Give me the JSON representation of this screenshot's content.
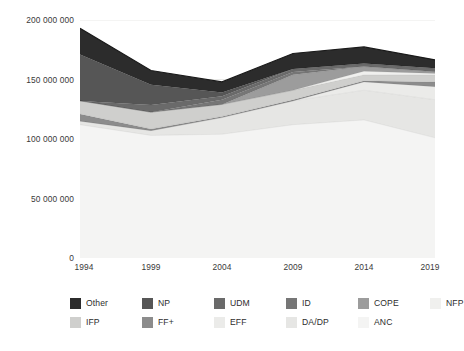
{
  "chart_data": {
    "type": "area",
    "stacked": true,
    "title": "",
    "subtitle": "",
    "xlabel": "",
    "ylabel": "",
    "x": [
      1994,
      1999,
      2004,
      2009,
      2014,
      2019
    ],
    "x_tick_labels": [
      "1994",
      "1999",
      "2004",
      "2009",
      "2014",
      "2019"
    ],
    "y_tick_labels": [
      "0",
      "50 000 000",
      "100 000 000",
      "150 000 000",
      "200 000 000"
    ],
    "y_tick_values": [
      0,
      50000000,
      100000000,
      150000000,
      200000000
    ],
    "ylim": [
      0,
      200000000
    ],
    "xlim": [
      1994,
      2019
    ],
    "grid": "horizontal",
    "legend_position": "bottom",
    "series": [
      {
        "name": "ANC",
        "color": "#f4f4f3",
        "values": [
          112000000,
          103000000,
          104000000,
          112000000,
          116000000,
          101000000
        ]
      },
      {
        "name": "DA/DP",
        "color": "#e6e6e4",
        "values": [
          3000000,
          4000000,
          14000000,
          20000000,
          25000000,
          32000000
        ]
      },
      {
        "name": "EFF",
        "color": "#ebebe9",
        "values": [
          0,
          0,
          0,
          0,
          7000000,
          11000000
        ]
      },
      {
        "name": "FF+",
        "color": "#8c8c8c",
        "values": [
          6000000,
          1500000,
          1000000,
          900000,
          900000,
          4000000
        ]
      },
      {
        "name": "IFP",
        "color": "#cfcfcd",
        "values": [
          11000000,
          14000000,
          10000000,
          8000000,
          5000000,
          6000000
        ]
      },
      {
        "name": "NFP",
        "color": "#f0f0ee",
        "values": [
          0,
          0,
          0,
          0,
          3000000,
          1000000
        ]
      },
      {
        "name": "COPE",
        "color": "#9c9c9c",
        "values": [
          0,
          0,
          0,
          13000000,
          4000000,
          1500000
        ]
      },
      {
        "name": "ID",
        "color": "#767676",
        "values": [
          0,
          0,
          4000000,
          2500000,
          0,
          0
        ]
      },
      {
        "name": "UDM",
        "color": "#6a6a6a",
        "values": [
          0,
          6000000,
          3000000,
          2500000,
          2500000,
          3000000
        ]
      },
      {
        "name": "NP",
        "color": "#565656",
        "values": [
          39000000,
          17000000,
          3000000,
          0,
          0,
          0
        ]
      },
      {
        "name": "Other",
        "color": "#2c2c2c",
        "values": [
          22000000,
          12000000,
          9000000,
          13000000,
          14000000,
          7000000
        ]
      }
    ],
    "totals": [
      193000000,
      157500000,
      148000000,
      171900000,
      177400000,
      166500000
    ],
    "annotations": []
  },
  "axes": {
    "y_ticks": [
      {
        "label": "200 000 000",
        "value": 200000000
      },
      {
        "label": "150 000 000",
        "value": 150000000
      },
      {
        "label": "100 000 000",
        "value": 100000000
      },
      {
        "label": "50 000 000",
        "value": 50000000
      },
      {
        "label": "0",
        "value": 0
      }
    ],
    "x_ticks": [
      {
        "label": "1994",
        "value": 1994
      },
      {
        "label": "1999",
        "value": 1999
      },
      {
        "label": "2004",
        "value": 2004
      },
      {
        "label": "2009",
        "value": 2009
      },
      {
        "label": "2014",
        "value": 2014
      },
      {
        "label": "2019",
        "value": 2019
      }
    ]
  },
  "legend": {
    "rows": [
      [
        {
          "label": "Other",
          "color": "#2c2c2c"
        },
        {
          "label": "NP",
          "color": "#565656"
        },
        {
          "label": "UDM",
          "color": "#6a6a6a"
        },
        {
          "label": "ID",
          "color": "#767676"
        },
        {
          "label": "COPE",
          "color": "#9c9c9c"
        },
        {
          "label": "NFP",
          "color": "#f0f0ee"
        }
      ],
      [
        {
          "label": "IFP",
          "color": "#cfcfcd"
        },
        {
          "label": "FF+",
          "color": "#8c8c8c"
        },
        {
          "label": "EFF",
          "color": "#ebebe9"
        },
        {
          "label": "DA/DP",
          "color": "#e6e6e4"
        },
        {
          "label": "ANC",
          "color": "#f4f4f3"
        }
      ]
    ]
  },
  "style": {
    "grid_color": "#e3e3e1",
    "text_color": "#3a3a3a",
    "background": "#ffffff"
  }
}
